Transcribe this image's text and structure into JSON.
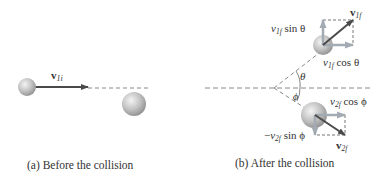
{
  "panels": [
    {
      "id": "a",
      "caption": "(a) Before the collision",
      "vector_label": {
        "base": "v",
        "sub": "1i"
      }
    },
    {
      "id": "b",
      "caption": "(b) After the collision",
      "labels": {
        "v1f": {
          "base": "v",
          "sub": "1f"
        },
        "v1f_sin": {
          "base": "v",
          "sub": "1f",
          "rest": " sin θ"
        },
        "v1f_cos": {
          "base": "v",
          "sub": "1f",
          "rest": " cos θ"
        },
        "theta": "θ",
        "phi": "ϕ",
        "v2f_cos": {
          "base": "v",
          "sub": "2f",
          "rest": " cos ϕ"
        },
        "v2f_sin": {
          "prefix": "−",
          "base": "v",
          "sub": "2f",
          "rest": " sin ϕ"
        },
        "v2f": {
          "base": "v",
          "sub": "2f"
        }
      }
    }
  ],
  "colors": {
    "arrow_dark": "#4a4a4a",
    "arrow_light": "#9aa3ad",
    "dashed": "#888888",
    "sphere": "#c8c8c8"
  }
}
